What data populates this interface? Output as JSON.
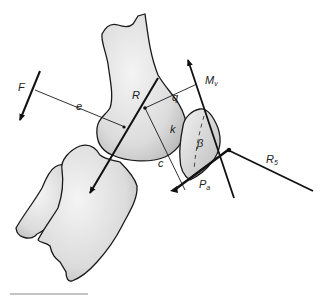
{
  "diagram": {
    "labels": {
      "F": "F",
      "e": "e",
      "R": "R",
      "q": "q",
      "k": "k",
      "c": "c",
      "beta": "β",
      "Mv_main": "M",
      "Mv_sub": "v",
      "Pa_main": "P",
      "Pa_sub": "a",
      "R5_main": "R",
      "R5_sub": "5"
    },
    "elements": [
      "femur",
      "tibia",
      "fibula",
      "patella",
      "force-F",
      "force-R",
      "force-Mv",
      "force-Pa",
      "force-R5",
      "lever-arm-e",
      "lever-arm-q",
      "lever-arm-c"
    ],
    "colors": {
      "stroke": "#1a1a1a",
      "bone_fill": "#e4e4e4",
      "bone_shade": "#c8c8c8",
      "background": "#ffffff",
      "scale_bar": "#8a8a8a"
    }
  }
}
